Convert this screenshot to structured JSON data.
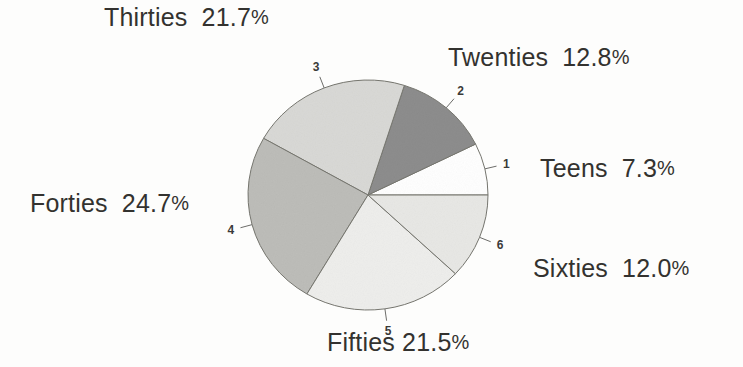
{
  "figure": {
    "title": "",
    "background_color": "#fdfdfc",
    "text_color": "#33322f"
  },
  "chart_data": {
    "type": "pie",
    "title": "",
    "xlabel": "",
    "ylabel": "",
    "legend_position": "callout-labels-around-pie",
    "grid": false,
    "start_angle_deg": 0,
    "direction": "counterclockwise",
    "units": "percent",
    "total": 100.0,
    "categories": [
      "Teens",
      "Twenties",
      "Thirties",
      "Forties",
      "Fifties",
      "Sixties"
    ],
    "values": [
      7.3,
      12.8,
      21.7,
      24.7,
      21.5,
      12.0
    ],
    "slice_numbers": [
      "1",
      "2",
      "3",
      "4",
      "5",
      "6"
    ],
    "colors": [
      "#ffffff",
      "#8d8d8d",
      "#d9d9d6",
      "#bdbdb9",
      "#eeeeec",
      "#e8e8e5"
    ],
    "slices": [
      {
        "number": "1",
        "label": "Teens",
        "value": 7.3,
        "value_text": "7.3",
        "percent_text": "7.3%",
        "color": "#ffffff"
      },
      {
        "number": "2",
        "label": "Twenties",
        "value": 12.8,
        "value_text": "12.8",
        "percent_text": "12.8%",
        "color": "#8d8d8d"
      },
      {
        "number": "3",
        "label": "Thirties",
        "value": 21.7,
        "value_text": "21.7",
        "percent_text": "21.7%",
        "color": "#d9d9d6"
      },
      {
        "number": "4",
        "label": "Forties",
        "value": 24.7,
        "value_text": "24.7",
        "percent_text": "24.7%",
        "color": "#bdbdb9"
      },
      {
        "number": "5",
        "label": "Fifties",
        "value": 21.5,
        "value_text": "21.5",
        "percent_text": "21.5%",
        "color": "#eeeeec"
      },
      {
        "number": "6",
        "label": "Sixties",
        "value": 12.0,
        "value_text": "12.0",
        "percent_text": "12.0%",
        "color": "#e8e8e5"
      }
    ]
  },
  "callouts": {
    "thirties": {
      "category": "Thirties",
      "value": "21.7",
      "percent_sign": "%"
    },
    "twenties": {
      "category": "Twenties",
      "value": "12.8",
      "percent_sign": "%"
    },
    "teens": {
      "category": "Teens",
      "value": "7.3",
      "percent_sign": "%"
    },
    "sixties": {
      "category": "Sixties",
      "value": "12.0",
      "percent_sign": "%"
    },
    "forties": {
      "category": "Forties",
      "value": "24.7",
      "percent_sign": "%"
    },
    "fifties": {
      "category": "Fifties",
      "value": "21.5",
      "percent_sign": "%"
    }
  },
  "slice_labels": {
    "one": "1",
    "two": "2",
    "three": "3",
    "four": "4",
    "five": "5",
    "six": "6"
  }
}
